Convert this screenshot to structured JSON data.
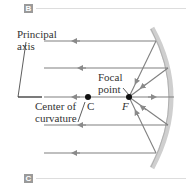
{
  "panel_labels": {
    "top": "B",
    "bottom": "C"
  },
  "labels": {
    "principal_axis_line1": "Principal",
    "principal_axis_line2": "axis",
    "focal_point_line1": "Focal",
    "focal_point_line2": "point",
    "center_line1": "Center of",
    "center_line2": "curvature",
    "c_letter": "C",
    "f_letter": "F"
  },
  "colors": {
    "ray": "#808080",
    "mirror": "#c8c8c8",
    "axis": "#222222",
    "text": "#333333",
    "tag": "#9a9a9a"
  }
}
